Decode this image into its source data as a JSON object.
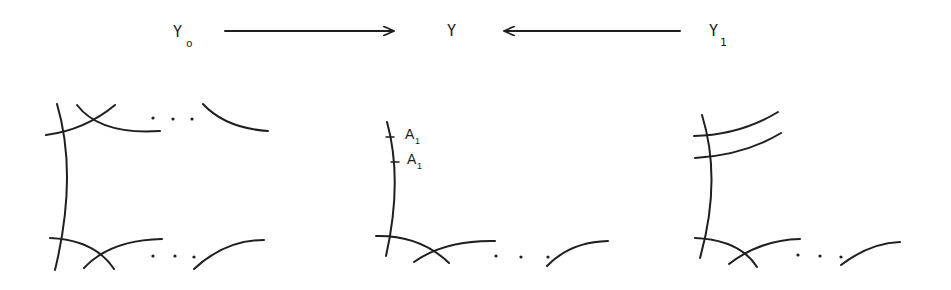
{
  "diagram": {
    "top_row": {
      "left": {
        "label": "Y",
        "subscript": "o"
      },
      "center": {
        "label": "Y"
      },
      "right": {
        "label": "Y",
        "subscript": "1"
      },
      "arrows": [
        {
          "from": "Y_o",
          "to": "Y",
          "direction": "right"
        },
        {
          "from": "Y_1",
          "to": "Y",
          "direction": "left"
        }
      ]
    },
    "panels": [
      {
        "name": "Y_o-configuration",
        "ellipsis": "..."
      },
      {
        "name": "Y-configuration",
        "ellipsis": "...",
        "marks": [
          {
            "label": "A",
            "subscript": "1"
          },
          {
            "label": "A",
            "subscript": "1"
          }
        ]
      },
      {
        "name": "Y_1-configuration",
        "ellipsis": "..."
      }
    ]
  }
}
